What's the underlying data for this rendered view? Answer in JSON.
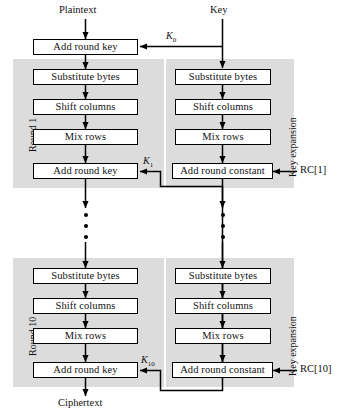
{
  "diagram": {
    "io": {
      "plaintext": "Plaintext",
      "key": "Key",
      "ciphertext": "Ciphertext"
    },
    "initial_round": {
      "add_round_key": "Add round key"
    },
    "round_labels": {
      "round_1": "Round 1",
      "round_10": "Round 10",
      "key_expansion_1": "Key expansion",
      "key_expansion_10": "Key expansion"
    },
    "steps": {
      "substitute_bytes": "Substitute bytes",
      "shift_columns": "Shift columns",
      "mix_rows": "Mix rows",
      "add_round_key": "Add round key",
      "add_round_constant": "Add round constant"
    },
    "subkeys": {
      "k0": "K",
      "k0_sub": "0",
      "k1": "K",
      "k1_sub": "1",
      "k10": "K",
      "k10_sub": "10"
    },
    "round_constants": {
      "rc1": "RC[1]",
      "rc10": "RC[10]"
    },
    "ellipsis_note": "vertical ellipsis indicating rounds 2 through 9",
    "colors": {
      "panel_fill": "#dcdcdc",
      "box_fill": "#ffffff",
      "stroke": "#000000",
      "page_background": "#ffffff"
    }
  }
}
